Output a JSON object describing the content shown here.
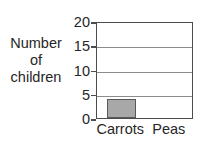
{
  "chart_data": {
    "type": "bar",
    "title": "",
    "subtitle": "",
    "xlabel": "",
    "ylabel_lines": [
      "Number",
      "of",
      "children"
    ],
    "categories": [
      "Carrots",
      "Peas"
    ],
    "values": [
      4,
      0
    ],
    "series": [
      {
        "name": "children",
        "values": [
          4,
          0
        ]
      }
    ],
    "ylim": [
      0,
      20
    ],
    "ytick_values": [
      20,
      15,
      10,
      5,
      0
    ],
    "ytick_labels": [
      "20",
      "15",
      "10",
      "5",
      "0"
    ],
    "ytick_interval": 5,
    "grid": true,
    "grid_axis": "y",
    "legend": false,
    "legend_position": "none",
    "bar_fill_color": "#a8a8a8",
    "bar_border_color": "#595959",
    "axis_color": "#4d4d4d",
    "grid_color": "#8c8c8c",
    "background_color": "#ffffff",
    "annotations": []
  }
}
